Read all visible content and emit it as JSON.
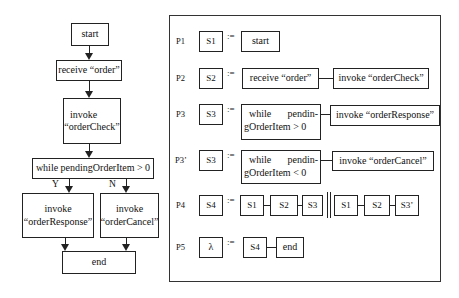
{
  "flowchart": {
    "start": "start",
    "receive": "receive “order”",
    "invoke_check": [
      "invoke",
      "“orderCheck”"
    ],
    "while": "while pendingOrderItem > 0",
    "branch_yes_label": "Y",
    "branch_no_label": "N",
    "invoke_response": [
      "invoke",
      "“orderResponse”"
    ],
    "invoke_cancel": [
      "invoke",
      "“orderCancel”"
    ],
    "end": "end"
  },
  "grammar": {
    "assign_symbol": ":=",
    "rules": [
      {
        "id": "P1",
        "lhs": "S1",
        "rhs": [
          "start"
        ]
      },
      {
        "id": "P2",
        "lhs": "S2",
        "rhs": [
          "receive “order”",
          "invoke “orderCheck”"
        ]
      },
      {
        "id": "P3",
        "lhs": "S3",
        "rhs_while": [
          "while",
          "pendin-",
          "gOrderItem > 0"
        ],
        "rhs": [
          "invoke “orderResponse”"
        ]
      },
      {
        "id": "P3’",
        "lhs": "S3",
        "rhs_while": [
          "while",
          "pendin-",
          "gOrderItem < 0"
        ],
        "rhs": [
          "invoke “orderCancel”"
        ]
      },
      {
        "id": "P4",
        "lhs": "S4",
        "rhs_a": [
          "S1",
          "S2",
          "S3"
        ],
        "rhs_b": [
          "S1",
          "S2",
          "S3’"
        ]
      },
      {
        "id": "P5",
        "lhs": "λ",
        "rhs": [
          "S4",
          "end"
        ]
      }
    ]
  }
}
